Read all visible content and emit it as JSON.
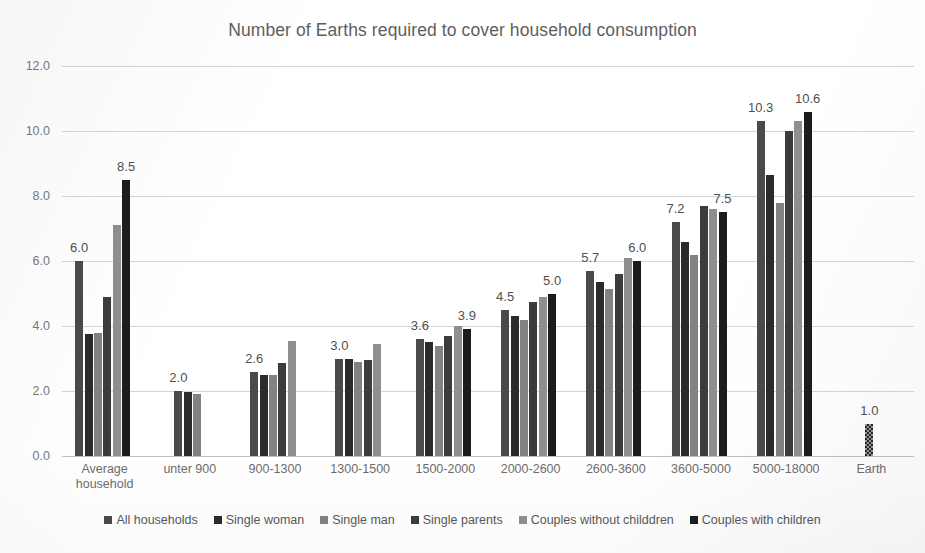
{
  "chart_data": {
    "type": "bar",
    "title": "Number of Earths required to cover household consumption",
    "xlabel": "",
    "ylabel": "",
    "ylim": [
      0,
      12
    ],
    "ytick_labels": [
      "0.0",
      "2.0",
      "4.0",
      "6.0",
      "8.0",
      "10.0",
      "12.0"
    ],
    "yticks": [
      0,
      2,
      4,
      6,
      8,
      10,
      12
    ],
    "grid": true,
    "legend_position": "bottom",
    "categories": [
      "Average household",
      "unter 900",
      "900-1300",
      "1300-1500",
      "1500-2000",
      "2000-2600",
      "2600-3600",
      "3600-5000",
      "5000-18000",
      "Earth"
    ],
    "category_lines": [
      [
        "Average",
        "household"
      ],
      [
        "unter 900"
      ],
      [
        "900-1300"
      ],
      [
        "1300-1500"
      ],
      [
        "1500-2000"
      ],
      [
        "2000-2600"
      ],
      [
        "2600-3600"
      ],
      [
        "3600-5000"
      ],
      [
        "5000-18000"
      ],
      [
        "Earth"
      ]
    ],
    "series": [
      {
        "name": "All households",
        "color": "#4a4a4a",
        "values": [
          6.0,
          2.0,
          2.6,
          3.0,
          3.6,
          4.5,
          5.7,
          7.2,
          10.3,
          null
        ]
      },
      {
        "name": "Single woman",
        "color": "#2b2b2b",
        "values": [
          3.75,
          1.98,
          2.5,
          3.0,
          3.5,
          4.3,
          5.35,
          6.6,
          8.65,
          null
        ]
      },
      {
        "name": "Single man",
        "color": "#828282",
        "values": [
          3.8,
          1.9,
          2.5,
          2.9,
          3.4,
          4.2,
          5.15,
          6.2,
          7.8,
          null
        ]
      },
      {
        "name": "Single parents",
        "color": "#3c3c3c",
        "values": [
          4.9,
          null,
          2.85,
          2.95,
          3.7,
          4.75,
          5.6,
          7.7,
          10.0,
          null
        ]
      },
      {
        "name": "Couples without childdren",
        "color": "#8f8f8f",
        "values": [
          7.1,
          null,
          3.55,
          3.45,
          4.0,
          4.9,
          6.1,
          7.6,
          10.3,
          null
        ]
      },
      {
        "name": "Couples with children",
        "color": "#1c1c1c",
        "values": [
          8.5,
          null,
          null,
          null,
          3.9,
          5.0,
          6.0,
          7.5,
          10.6,
          null
        ]
      },
      {
        "name": "Earth",
        "color": "#9a9a9a",
        "pattern": "checker",
        "values": [
          null,
          null,
          null,
          null,
          null,
          null,
          null,
          null,
          null,
          1.0
        ]
      }
    ],
    "data_labels": [
      {
        "category": 0,
        "text": "6.0",
        "value": 6.0,
        "series": 0
      },
      {
        "category": 0,
        "text": "8.5",
        "value": 8.5,
        "series": 5
      },
      {
        "category": 1,
        "text": "2.0",
        "value": 2.0,
        "series": 0
      },
      {
        "category": 2,
        "text": "2.6",
        "value": 2.6,
        "series": 0
      },
      {
        "category": 3,
        "text": "3.0",
        "value": 3.0,
        "series": 0
      },
      {
        "category": 4,
        "text": "3.6",
        "value": 3.6,
        "series": 0
      },
      {
        "category": 4,
        "text": "3.9",
        "value": 3.9,
        "series": 5
      },
      {
        "category": 5,
        "text": "4.5",
        "value": 4.5,
        "series": 0
      },
      {
        "category": 5,
        "text": "5.0",
        "value": 5.0,
        "series": 5
      },
      {
        "category": 6,
        "text": "5.7",
        "value": 5.7,
        "series": 0
      },
      {
        "category": 6,
        "text": "6.0",
        "value": 6.0,
        "series": 5
      },
      {
        "category": 7,
        "text": "7.2",
        "value": 7.2,
        "series": 0
      },
      {
        "category": 7,
        "text": "7.5",
        "value": 7.5,
        "series": 5
      },
      {
        "category": 8,
        "text": "10.3",
        "value": 10.3,
        "series": 0
      },
      {
        "category": 8,
        "text": "10.6",
        "value": 10.6,
        "series": 5
      },
      {
        "category": 9,
        "text": "1.0",
        "value": 1.0,
        "series": 6
      }
    ],
    "legend": [
      {
        "label": "All households",
        "color": "#4a4a4a"
      },
      {
        "label": "Single woman",
        "color": "#2b2b2b"
      },
      {
        "label": "Single man",
        "color": "#828282"
      },
      {
        "label": "Single parents",
        "color": "#3c3c3c"
      },
      {
        "label": "Couples without childdren",
        "color": "#8f8f8f"
      },
      {
        "label": "Couples with children",
        "color": "#1c1c1c"
      }
    ]
  }
}
